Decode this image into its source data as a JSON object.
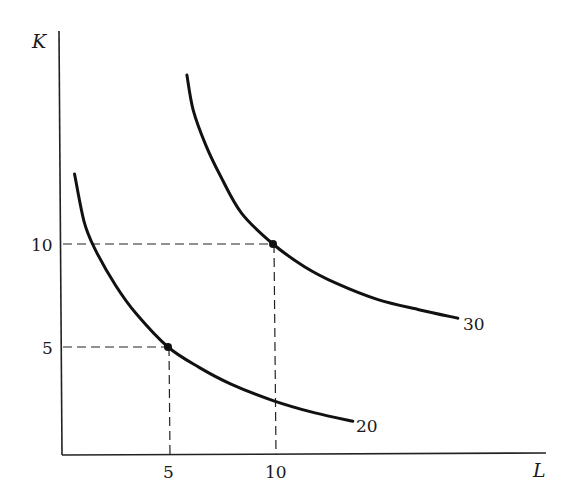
{
  "chart_data": {
    "type": "line",
    "title": "",
    "xlabel": "L",
    "ylabel": "K",
    "xlim": [
      0,
      23
    ],
    "ylim": [
      0,
      20
    ],
    "grid": false,
    "legend": "none (curves labeled at ends)",
    "x_ticks": [
      5,
      10
    ],
    "y_ticks": [
      5,
      10
    ],
    "series": [
      {
        "name": "20",
        "label": "20",
        "description": "isoquant through (5,5)",
        "points": [
          [
            0.55,
            13.4
          ],
          [
            1.0,
            11.1
          ],
          [
            1.5,
            9.8
          ],
          [
            2.5,
            8.0
          ],
          [
            3.5,
            6.6
          ],
          [
            5,
            5
          ],
          [
            6.5,
            4.0
          ],
          [
            8,
            3.2
          ],
          [
            10,
            2.4
          ],
          [
            12,
            1.8
          ],
          [
            13.8,
            1.4
          ]
        ]
      },
      {
        "name": "30",
        "label": "30",
        "description": "isoquant through (10,10)",
        "points": [
          [
            5.9,
            18.2
          ],
          [
            6.2,
            16.5
          ],
          [
            6.8,
            14.8
          ],
          [
            7.5,
            13.3
          ],
          [
            8.5,
            11.5
          ],
          [
            10,
            10
          ],
          [
            11.5,
            8.9
          ],
          [
            13,
            8.1
          ],
          [
            15,
            7.3
          ],
          [
            17,
            6.8
          ],
          [
            18.8,
            6.4
          ]
        ]
      }
    ],
    "highlighted_points": [
      {
        "x": 5,
        "y": 5,
        "on": "20"
      },
      {
        "x": 10,
        "y": 10,
        "on": "30"
      }
    ],
    "reference_lines": [
      {
        "type": "dashed",
        "from": [
          0,
          5
        ],
        "to": [
          5,
          5
        ]
      },
      {
        "type": "dashed",
        "from": [
          5,
          0
        ],
        "to": [
          5,
          5
        ]
      },
      {
        "type": "dashed",
        "from": [
          0,
          10
        ],
        "to": [
          10,
          10
        ]
      },
      {
        "type": "dashed",
        "from": [
          10,
          0
        ],
        "to": [
          10,
          10
        ]
      }
    ]
  },
  "labels": {
    "y_axis": "K",
    "x_axis": "L",
    "y_tick_5": "5",
    "y_tick_10": "10",
    "x_tick_5": "5",
    "x_tick_10": "10",
    "curve_20": "20",
    "curve_30": "30"
  },
  "colors": {
    "ink": "#111111",
    "background": "#ffffff"
  }
}
